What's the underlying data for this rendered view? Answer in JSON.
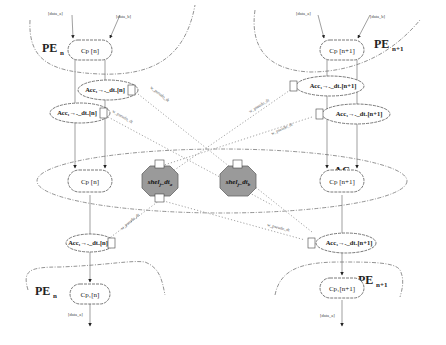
{
  "diagram": {
    "regions": {
      "pe_top_left": {
        "label": "PE",
        "sub": "n"
      },
      "pe_top_right": {
        "label": "PE",
        "sub": "n+1"
      },
      "pe_bottom_left": {
        "label": "PE",
        "sub": "n"
      },
      "pe_bottom_right": {
        "label": "PE",
        "sub": "n+1"
      },
      "ac": {
        "label": "AC",
        "sub": "m"
      }
    },
    "inputs": {
      "tl_a": "[data_a]",
      "tl_b": "[data_b]",
      "tr_a": "[data_a]",
      "tr_b": "[data_b]"
    },
    "outputs": {
      "bl": "[data_a]",
      "br": "[data_a]"
    },
    "nodes": {
      "cp_n_top": "Cp [n]",
      "cp_n1_top": "Cp [n+1]",
      "acc_n_a": "Acc₁→ₐ_dtₐ[n]",
      "acc_n_b": "Acc₁→ₐ_dtₐ[n]",
      "acc_n1_a": "Acc₁→ₐ_dtₐ[n+1]",
      "acc_n1_b": "Acc₁→ₐ_dtₐ[n+1]",
      "cp_n_mid": "Cp [n]",
      "cp_n1_mid": "Cp [n+1]",
      "acc_n_c": "Acc₁→ₐ_dtₐ[n]",
      "acc_n1_c": "Acc₁→ₐ_dtₐ[n+1]",
      "cp_n_bot": "Cp₁[n]",
      "cp_n1_bot": "Cp₁[n+1]"
    },
    "shelters": {
      "left": {
        "main": "shel",
        "sub": "j",
        "rest": "_dt",
        "sub2": "a"
      },
      "right": {
        "main": "shel",
        "sub": "j",
        "rest": "_dt",
        "sub2": "b"
      }
    },
    "connections": {
      "label": "w_pseudo_dt"
    }
  }
}
